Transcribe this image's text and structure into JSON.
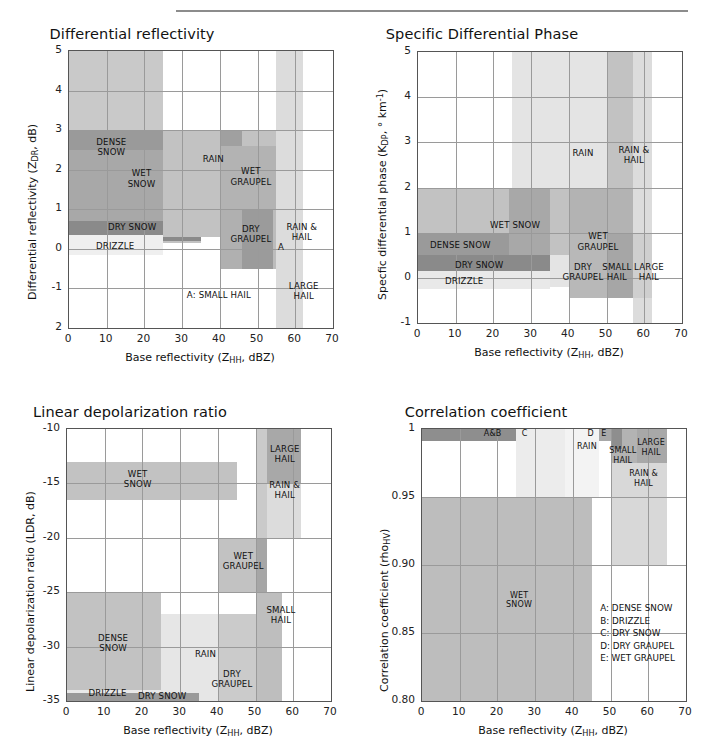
{
  "figure": {
    "width": 701,
    "height": 744,
    "background": "#ffffff",
    "rule_color": "#8c8c8c"
  },
  "palette": {
    "dense_snow": "#9a9a9a",
    "wet_snow": "#b5b5b5",
    "dry_snow": "#8a8a8a",
    "drizzle": "#efefef",
    "rain": "#c9c9c9",
    "wet_graupel": "#a8a8a8",
    "dry_graupel": "#b0b0b0",
    "small_hail": "#9e9e9e",
    "large_hail": "#cfcfcf",
    "rain_hail": "#c2c2c2",
    "light": "#e2e2e2",
    "lighter": "#f2f2f2",
    "grid": "#9a9a9a",
    "axis": "#555555"
  },
  "common": {
    "xlabel_pre": "Base reflectivity (Z",
    "xlabel_sub": "HH",
    "xlabel_post": ", dBZ)",
    "x_ticks": [
      "0",
      "10",
      "20",
      "30",
      "40",
      "50",
      "60",
      "70"
    ],
    "xlim": [
      0,
      70
    ]
  },
  "chart_data": [
    {
      "id": "zdr",
      "type": "heatmap",
      "title": "Differential reflectivity",
      "xlabel": "Base reflectivity (ZHH, dBZ)",
      "ylabel": "Differential reflectivity (ZDR, dB)",
      "ylabel_pre": "Differential reflectivity (Z",
      "ylabel_sub": "DR",
      "ylabel_post": ", dB)",
      "xlim": [
        0,
        70
      ],
      "ylim": [
        -2,
        5
      ],
      "x_ticks": [
        "0",
        "10",
        "20",
        "30",
        "40",
        "50",
        "60",
        "70"
      ],
      "y_ticks": [
        "5",
        "4",
        "3",
        "2",
        "1",
        "0",
        "-1",
        "2"
      ],
      "grid": true,
      "regions": [
        {
          "name": "dense-snow",
          "x0": 0,
          "x1": 25,
          "y0": 1.2,
          "y1": 5.0,
          "color": "#c9c9c9"
        },
        {
          "name": "dense-snow-core",
          "x0": 0,
          "x1": 25,
          "y0": 1.2,
          "y1": 3.0,
          "color": "#9a9a9a"
        },
        {
          "name": "wet-snow",
          "x0": 0,
          "x1": 35,
          "y0": 0.15,
          "y1": 2.5,
          "color": "#a8a8a8"
        },
        {
          "name": "wet-snow-band",
          "x0": 25,
          "x1": 35,
          "y0": 0.15,
          "y1": 2.5,
          "color": "#c2c2c2"
        },
        {
          "name": "dry-snow",
          "x0": 0,
          "x1": 35,
          "y0": 0.2,
          "y1": 0.7,
          "color": "#8a8a8a"
        },
        {
          "name": "drizzle",
          "x0": 0,
          "x1": 25,
          "y0": -0.15,
          "y1": 0.35,
          "color": "#efefef"
        },
        {
          "name": "rain",
          "x0": 25,
          "x1": 57,
          "y0": 0.3,
          "y1": 3.0,
          "color": "#c2c2c2"
        },
        {
          "name": "rain-dark",
          "x0": 40,
          "x1": 46,
          "y0": 0.3,
          "y1": 3.0,
          "color": "#a0a0a0"
        },
        {
          "name": "wet-graupel",
          "x0": 40,
          "x1": 57,
          "y0": 0.4,
          "y1": 2.6,
          "color": "#b3b3b3"
        },
        {
          "name": "dry-graupel",
          "x0": 40,
          "x1": 57,
          "y0": -0.5,
          "y1": 1.0,
          "color": "#b0b0b0"
        },
        {
          "name": "dry-graupel-core",
          "x0": 46,
          "x1": 55,
          "y0": -0.5,
          "y1": 1.0,
          "color": "#9b9b9b"
        },
        {
          "name": "small-hail",
          "x0": 54,
          "x1": 57,
          "y0": -0.5,
          "y1": 1.0,
          "color": "#bcbcbc"
        },
        {
          "name": "rain-and-hail",
          "x0": 55,
          "x1": 62,
          "y0": -0.5,
          "y1": 1.0,
          "color": "#c4c4c4"
        },
        {
          "name": "large-hail",
          "x0": 55,
          "x1": 62,
          "y0": -2.0,
          "y1": 5.0,
          "color": "#dcdcdc"
        }
      ],
      "labels": [
        {
          "text": "DENSE\nSNOW",
          "x": 11.5,
          "y": 2.55
        },
        {
          "text": "WET\nSNOW",
          "x": 19.5,
          "y": 1.75
        },
        {
          "text": "RAIN",
          "x": 38.5,
          "y": 2.25
        },
        {
          "text": "WET\nGRAUPEL",
          "x": 48.5,
          "y": 1.8
        },
        {
          "text": "DRY SNOW",
          "x": 17.0,
          "y": 0.52
        },
        {
          "text": "DRIZZLE",
          "x": 12.5,
          "y": 0.05
        },
        {
          "text": "DRY\nGRAUPEL",
          "x": 48.5,
          "y": 0.35
        },
        {
          "text": "RAIN &\nHAIL",
          "x": 62.0,
          "y": 0.4
        },
        {
          "text": "A",
          "x": 56.5,
          "y": 0.02
        },
        {
          "text": "A: SMALL HAIL",
          "x": 40.0,
          "y": -1.2
        },
        {
          "text": "LARGE\nHAIL",
          "x": 62.5,
          "y": -1.1
        }
      ]
    },
    {
      "id": "kdp",
      "type": "heatmap",
      "title": "Specific Differential Phase",
      "xlabel": "Base reflectivity (ZHH, dBZ)",
      "ylabel": "Specfic differential phase (KDP, ° km-1)",
      "ylabel_pre": "Specfic differential phase (K",
      "ylabel_sub": "DP",
      "ylabel_mid": ", ° km",
      "ylabel_sup": "-1",
      "ylabel_post": ")",
      "xlim": [
        0,
        70
      ],
      "ylim": [
        -1,
        5
      ],
      "x_ticks": [
        "0",
        "10",
        "20",
        "30",
        "40",
        "50",
        "60",
        "70"
      ],
      "y_ticks": [
        "5",
        "4",
        "3",
        "2",
        "1",
        "0",
        "-1"
      ],
      "grid": true,
      "regions": [
        {
          "name": "rain",
          "x0": 25,
          "x1": 57,
          "y0": -0.2,
          "y1": 5.0,
          "color": "#e4e4e4"
        },
        {
          "name": "rain-hail",
          "x0": 50,
          "x1": 57,
          "y0": -0.2,
          "y1": 5.0,
          "color": "#c2c2c2"
        },
        {
          "name": "large-hail-col",
          "x0": 57,
          "x1": 62,
          "y0": -1.0,
          "y1": 5.0,
          "color": "#dcdcdc"
        },
        {
          "name": "wet-snow",
          "x0": 0,
          "x1": 45,
          "y0": 0.5,
          "y1": 2.0,
          "color": "#c2c2c2"
        },
        {
          "name": "wet-snow-dark",
          "x0": 24,
          "x1": 35,
          "y0": 0.5,
          "y1": 2.0,
          "color": "#a8a8a8"
        },
        {
          "name": "dense-snow",
          "x0": 0,
          "x1": 24,
          "y0": 0.45,
          "y1": 1.0,
          "color": "#9a9a9a"
        },
        {
          "name": "dry-snow",
          "x0": 0,
          "x1": 35,
          "y0": 0.0,
          "y1": 0.5,
          "color": "#8a8a8a"
        },
        {
          "name": "drizzle",
          "x0": 0,
          "x1": 35,
          "y0": -0.25,
          "y1": 0.15,
          "color": "#e9e9e9"
        },
        {
          "name": "wet-graupel",
          "x0": 40,
          "x1": 57,
          "y0": 0.4,
          "y1": 2.0,
          "color": "#b3b3b3"
        },
        {
          "name": "dry-graupel",
          "x0": 40,
          "x1": 50,
          "y0": -0.45,
          "y1": 1.0,
          "color": "#b8b8b8"
        },
        {
          "name": "small-hail",
          "x0": 50,
          "x1": 57,
          "y0": -0.45,
          "y1": 1.0,
          "color": "#a6a6a6"
        },
        {
          "name": "large-hail",
          "x0": 57,
          "x1": 62,
          "y0": -0.45,
          "y1": 1.0,
          "color": "#cfcfcf"
        }
      ],
      "labels": [
        {
          "text": "RAIN",
          "x": 44.0,
          "y": 2.75
        },
        {
          "text": "RAIN &\nHAIL",
          "x": 57.5,
          "y": 2.7
        },
        {
          "text": "WET SNOW",
          "x": 26.0,
          "y": 1.15
        },
        {
          "text": "DENSE SNOW",
          "x": 11.5,
          "y": 0.7
        },
        {
          "text": "DRY SNOW",
          "x": 16.5,
          "y": 0.25
        },
        {
          "text": "DRIZZLE",
          "x": 12.5,
          "y": -0.1
        },
        {
          "text": "WET\nGRAUPEL",
          "x": 48.0,
          "y": 0.78
        },
        {
          "text": "DRY\nGRAUPEL",
          "x": 44.0,
          "y": 0.1
        },
        {
          "text": "SMALL\nHAIL",
          "x": 53.0,
          "y": 0.1
        },
        {
          "text": "LARGE\nHAIL",
          "x": 61.5,
          "y": 0.1
        }
      ]
    },
    {
      "id": "ldr",
      "type": "heatmap",
      "title": "Linear depolarization ratio",
      "xlabel": "Base reflectivity (ZHH, dBZ)",
      "ylabel": "Linear depolarization ratio (LDR, dB)",
      "ylabel_pre": "Linear depolarization ratio (LDR, dB)",
      "xlim": [
        0,
        70
      ],
      "ylim": [
        -35,
        -10
      ],
      "x_ticks": [
        "0",
        "10",
        "20",
        "30",
        "40",
        "50",
        "60",
        "70"
      ],
      "y_ticks": [
        "-10",
        "-15",
        "-20",
        "-25",
        "-30",
        "-35"
      ],
      "grid": true,
      "regions": [
        {
          "name": "wet-snow",
          "x0": 0,
          "x1": 45,
          "y0": -16.5,
          "y1": -13.0,
          "color": "#c2c2c2"
        },
        {
          "name": "large-hail",
          "x0": 50,
          "x1": 62,
          "y0": -15.0,
          "y1": -10.0,
          "color": "#a8a8a8"
        },
        {
          "name": "rain-hail",
          "x0": 50,
          "x1": 62,
          "y0": -20.0,
          "y1": -15.0,
          "color": "#dcdcdc"
        },
        {
          "name": "rain-hail-col",
          "x0": 50,
          "x1": 53,
          "y0": -35.0,
          "y1": -10.0,
          "color": "#cacaca"
        },
        {
          "name": "wet-graupel",
          "x0": 40,
          "x1": 53,
          "y0": -25.0,
          "y1": -20.0,
          "color": "#c2c2c2"
        },
        {
          "name": "wet-graupel-dark",
          "x0": 50,
          "x1": 53,
          "y0": -25.0,
          "y1": -20.0,
          "color": "#a6a6a6"
        },
        {
          "name": "dense-snow",
          "x0": 0,
          "x1": 25,
          "y0": -34.0,
          "y1": -25.0,
          "color": "#c2c2c2"
        },
        {
          "name": "rain",
          "x0": 25,
          "x1": 50,
          "y0": -35.0,
          "y1": -27.0,
          "color": "#e6e6e6"
        },
        {
          "name": "dry-graupel",
          "x0": 40,
          "x1": 50,
          "y0": -35.0,
          "y1": -27.0,
          "color": "#cbcbcb"
        },
        {
          "name": "small-hail",
          "x0": 50,
          "x1": 57,
          "y0": -35.0,
          "y1": -25.0,
          "color": "#bebebe"
        },
        {
          "name": "drizzle",
          "x0": 0,
          "x1": 25,
          "y0": -35.0,
          "y1": -34.0,
          "color": "#e9e9e9"
        },
        {
          "name": "dry-snow",
          "x0": 0,
          "x1": 35,
          "y0": -35.0,
          "y1": -34.3,
          "color": "#9a9a9a"
        }
      ],
      "labels": [
        {
          "text": "WET\nSNOW",
          "x": 19.0,
          "y": -14.7
        },
        {
          "text": "LARGE\nHAIL",
          "x": 58.0,
          "y": -12.4
        },
        {
          "text": "RAIN &\nHAIL",
          "x": 58.0,
          "y": -15.7
        },
        {
          "text": "WET\nGRAUPEL",
          "x": 47.0,
          "y": -22.2
        },
        {
          "text": "SMALL\nHAIL",
          "x": 57.0,
          "y": -27.2
        },
        {
          "text": "DENSE\nSNOW",
          "x": 12.5,
          "y": -29.8
        },
        {
          "text": "RAIN",
          "x": 37.0,
          "y": -30.8
        },
        {
          "text": "DRY\nGRAUPEL",
          "x": 44.0,
          "y": -33.1
        },
        {
          "text": "DRIZZLE",
          "x": 11.0,
          "y": -34.4
        },
        {
          "text": "DRY SNOW",
          "x": 25.5,
          "y": -34.6
        }
      ]
    },
    {
      "id": "rhohv",
      "type": "heatmap",
      "title": "Correlation coefficient",
      "xlabel": "Base reflectivity (ZHH, dBZ)",
      "ylabel": "Correlation coefficient (rhoHV)",
      "ylabel_pre": "Correlation coefficient (rho",
      "ylabel_sub": "HV",
      "ylabel_post": ")",
      "xlim": [
        0,
        70
      ],
      "ylim": [
        0.8,
        1.0
      ],
      "x_ticks": [
        "0",
        "10",
        "20",
        "30",
        "40",
        "50",
        "60",
        "70"
      ],
      "y_ticks": [
        "1",
        "0.95",
        "0.90",
        "0.85",
        "0.80"
      ],
      "grid": true,
      "regions": [
        {
          "name": "a-and-b",
          "x0": 0,
          "x1": 38,
          "y0": 0.991,
          "y1": 1.0,
          "color": "#8e8e8e"
        },
        {
          "name": "d-and-e",
          "x0": 38,
          "x1": 50,
          "y0": 0.991,
          "y1": 1.0,
          "color": "#a8a8a8"
        },
        {
          "name": "rain",
          "x0": 25,
          "x1": 47,
          "y0": 0.95,
          "y1": 1.0,
          "color": "#ececec"
        },
        {
          "name": "rain-col",
          "x0": 38,
          "x1": 47,
          "y0": 0.95,
          "y1": 1.0,
          "color": "#f3f3f3"
        },
        {
          "name": "small-hail",
          "x0": 50,
          "x1": 57,
          "y0": 0.94,
          "y1": 1.0,
          "color": "#b3b3b3"
        },
        {
          "name": "small-hail-dark",
          "x0": 50,
          "x1": 53,
          "y0": 0.985,
          "y1": 1.0,
          "color": "#8e8e8e"
        },
        {
          "name": "large-hail",
          "x0": 57,
          "x1": 65,
          "y0": 0.975,
          "y1": 1.0,
          "color": "#a8a8a8"
        },
        {
          "name": "rain-and-hail",
          "x0": 50,
          "x1": 65,
          "y0": 0.9,
          "y1": 0.975,
          "color": "#d8d8d8"
        },
        {
          "name": "wet-snow",
          "x0": 0,
          "x1": 45,
          "y0": 0.8,
          "y1": 0.95,
          "color": "#bdbdbd"
        }
      ],
      "labels": [
        {
          "text": "A&B",
          "x": 19.0,
          "y": 0.9955
        },
        {
          "text": "C",
          "x": 27.5,
          "y": 0.9955
        },
        {
          "text": "D",
          "x": 45.0,
          "y": 0.9955
        },
        {
          "text": "E",
          "x": 48.5,
          "y": 0.9955
        },
        {
          "text": "RAIN",
          "x": 44.0,
          "y": 0.986
        },
        {
          "text": "LARGE\nHAIL",
          "x": 61.0,
          "y": 0.985
        },
        {
          "text": "SMALL\nHAIL",
          "x": 53.5,
          "y": 0.979
        },
        {
          "text": "RAIN &\nHAIL",
          "x": 59.0,
          "y": 0.962
        },
        {
          "text": "WET\nSNOW",
          "x": 26.0,
          "y": 0.873
        }
      ],
      "legend": "A: DENSE SNOW\nB: DRIZZLE\nC: DRY SNOW\nD: DRY GRAUPEL\nE: WET GRAUPEL"
    }
  ]
}
